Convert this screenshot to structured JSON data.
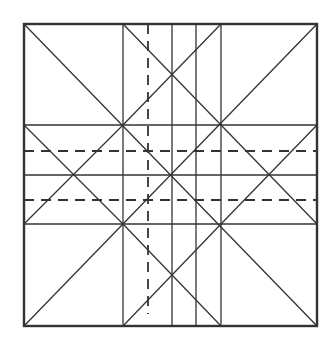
{
  "diagram": {
    "type": "fold-pattern-grid",
    "canvas": {
      "width": 332,
      "height": 343,
      "background": "#ffffff"
    },
    "stroke_color": "#333333",
    "border": {
      "x1": 24,
      "y1": 24,
      "x2": 317,
      "y2": 326,
      "stroke_width": 2.4
    },
    "vertical_lines": [
      {
        "x": 123,
        "style": "solid"
      },
      {
        "x": 148,
        "style": "dashed",
        "y1": 24,
        "y2": 314
      },
      {
        "x": 172,
        "style": "solid"
      },
      {
        "x": 196,
        "style": "solid"
      },
      {
        "x": 221,
        "style": "solid"
      }
    ],
    "horizontal_lines": [
      {
        "y": 125,
        "style": "solid"
      },
      {
        "y": 151,
        "style": "dashed"
      },
      {
        "y": 175,
        "style": "solid"
      },
      {
        "y": 200,
        "style": "dashed"
      },
      {
        "y": 224,
        "style": "solid"
      }
    ],
    "diagonals": [
      {
        "x1": 24,
        "y1": 24,
        "x2": 317,
        "y2": 326
      },
      {
        "x1": 317,
        "y1": 24,
        "x2": 24,
        "y2": 326
      },
      {
        "x1": 123,
        "y1": 24,
        "x2": 221,
        "y2": 125
      },
      {
        "x1": 221,
        "y1": 24,
        "x2": 123,
        "y2": 125
      },
      {
        "x1": 24,
        "y1": 125,
        "x2": 123,
        "y2": 224
      },
      {
        "x1": 123,
        "y1": 125,
        "x2": 24,
        "y2": 224
      },
      {
        "x1": 221,
        "y1": 125,
        "x2": 317,
        "y2": 224
      },
      {
        "x1": 317,
        "y1": 125,
        "x2": 221,
        "y2": 224
      },
      {
        "x1": 123,
        "y1": 224,
        "x2": 221,
        "y2": 326
      },
      {
        "x1": 221,
        "y1": 224,
        "x2": 123,
        "y2": 326
      }
    ]
  }
}
